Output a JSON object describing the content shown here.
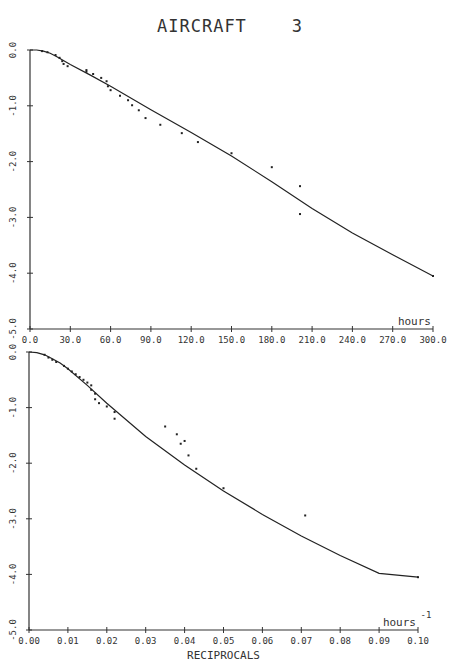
{
  "title": "AIRCRAFT    3",
  "chart_data": [
    {
      "type": "scatter",
      "title": "AIRCRAFT 3",
      "xlabel": "hours",
      "ylabel": "",
      "xlim": [
        0,
        300
      ],
      "ylim": [
        -5.0,
        0.0
      ],
      "x_ticks": [
        "0.0",
        "30.0",
        "60.0",
        "90.0",
        "120.0",
        "150.0",
        "180.0",
        "210.0",
        "240.0",
        "270.0",
        "300.0"
      ],
      "y_ticks": [
        "0.0",
        "-1.0",
        "-2.0",
        "-3.0",
        "-4.0",
        "-5.0"
      ],
      "grid": false,
      "series": [
        {
          "name": "observed",
          "kind": "points",
          "x": [
            9,
            13,
            19,
            22,
            24,
            25,
            28,
            42,
            42,
            47,
            53,
            57,
            58,
            60,
            67,
            73,
            76,
            81,
            86,
            97,
            113,
            125,
            150,
            180,
            201,
            201,
            300
          ],
          "y": [
            -0.02,
            -0.04,
            -0.09,
            -0.14,
            -0.2,
            -0.25,
            -0.29,
            -0.36,
            -0.39,
            -0.43,
            -0.5,
            -0.56,
            -0.65,
            -0.72,
            -0.82,
            -0.9,
            -0.99,
            -1.08,
            -1.22,
            -1.34,
            -1.49,
            -1.65,
            -1.85,
            -2.1,
            -2.44,
            -2.94,
            -4.05
          ]
        },
        {
          "name": "fitted",
          "kind": "line",
          "x": [
            0,
            5,
            10,
            15,
            20,
            30,
            45,
            60,
            90,
            120,
            150,
            180,
            210,
            240,
            270,
            300
          ],
          "y": [
            0.0,
            0.0,
            -0.02,
            -0.06,
            -0.12,
            -0.26,
            -0.45,
            -0.65,
            -1.07,
            -1.48,
            -1.9,
            -2.36,
            -2.84,
            -3.28,
            -3.67,
            -4.05
          ]
        }
      ]
    },
    {
      "type": "scatter",
      "title": "",
      "xlabel": "RECIPROCALS",
      "unit_label": "hours",
      "unit_exponent": "-1",
      "xlim": [
        0.0,
        0.1
      ],
      "ylim": [
        -5.0,
        0.0
      ],
      "x_ticks": [
        "0.00",
        "0.01",
        "0.02",
        "0.03",
        "0.04",
        "0.05",
        "0.06",
        "0.07",
        "0.08",
        "0.09",
        "0.10"
      ],
      "y_ticks": [
        "0.0",
        "-1.0",
        "-2.0",
        "-3.0",
        "-4.0",
        "-5.0"
      ],
      "grid": false,
      "series": [
        {
          "name": "observed",
          "kind": "points",
          "x": [
            0.004,
            0.005,
            0.006,
            0.007,
            0.009,
            0.01,
            0.011,
            0.012,
            0.013,
            0.014,
            0.015,
            0.016,
            0.016,
            0.017,
            0.017,
            0.018,
            0.02,
            0.022,
            0.022,
            0.035,
            0.038,
            0.039,
            0.04,
            0.041,
            0.043,
            0.05,
            0.071,
            0.1
          ],
          "y": [
            -0.05,
            -0.1,
            -0.14,
            -0.18,
            -0.25,
            -0.3,
            -0.35,
            -0.4,
            -0.45,
            -0.5,
            -0.55,
            -0.6,
            -0.68,
            -0.75,
            -0.85,
            -0.92,
            -0.98,
            -1.08,
            -1.2,
            -1.34,
            -1.48,
            -1.65,
            -1.6,
            -1.86,
            -2.1,
            -2.45,
            -2.94,
            -4.05
          ]
        },
        {
          "name": "fitted",
          "kind": "line",
          "x": [
            0,
            0.002,
            0.004,
            0.006,
            0.008,
            0.01,
            0.015,
            0.02,
            0.03,
            0.04,
            0.05,
            0.06,
            0.07,
            0.08,
            0.09,
            0.1
          ],
          "y": [
            0.0,
            -0.01,
            -0.05,
            -0.12,
            -0.2,
            -0.3,
            -0.6,
            -0.92,
            -1.52,
            -2.03,
            -2.5,
            -2.92,
            -3.31,
            -3.66,
            -3.98,
            -4.05
          ]
        }
      ]
    }
  ],
  "panels": [
    {
      "x0": 30,
      "x1": 433,
      "y0": 50,
      "y1": 329,
      "unit_text": "hours",
      "unit_sup": "",
      "xlabel_text": ""
    },
    {
      "x0": 29,
      "x1": 418,
      "y0": 352,
      "y1": 630,
      "unit_text": "hours",
      "unit_sup": "-1",
      "xlabel_text": "RECIPROCALS"
    }
  ]
}
